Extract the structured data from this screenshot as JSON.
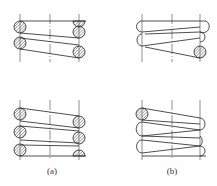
{
  "figure": {
    "panels": [
      {
        "id": "a",
        "caption": "(a)",
        "description": "Compression spring, sectional view with wire cross-sections at both sides"
      },
      {
        "id": "b",
        "caption": "(b)",
        "description": "Compression spring, outline view with single sectioned coil"
      }
    ],
    "colors": {
      "line": "#222222",
      "hatch": "#555555",
      "centerline": "#444444",
      "background": "#ffffff"
    }
  }
}
